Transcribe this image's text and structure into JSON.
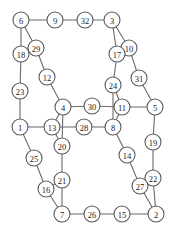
{
  "diagram": {
    "width": 178,
    "height": 232,
    "background_color": "#ffffff",
    "node_fill_color": "#ffffff",
    "node_stroke_color": "#5a5a5a",
    "edge_color": "#6b6b6b",
    "label_color": "#1a1a1a",
    "node_radius": 8,
    "node_count": 32,
    "edge_count": 48
  },
  "chart_data": {
    "type": "graph",
    "nodes": [
      {
        "id": 6,
        "label": "6",
        "x": 21,
        "y": 20
      },
      {
        "id": 9,
        "label": "9",
        "x": 55,
        "y": 20
      },
      {
        "id": 32,
        "label": "32",
        "x": 85,
        "y": 20
      },
      {
        "id": 3,
        "label": "3",
        "x": 112,
        "y": 20
      },
      {
        "id": 29,
        "label": "29",
        "x": 36,
        "y": 48
      },
      {
        "id": 10,
        "label": "10",
        "x": 129,
        "y": 48
      },
      {
        "id": 18,
        "label": "18",
        "x": 21,
        "y": 54
      },
      {
        "id": 17,
        "label": "17",
        "x": 117,
        "y": 54
      },
      {
        "id": 12,
        "label": "12",
        "x": 47,
        "y": 77
      },
      {
        "id": 31,
        "label": "31",
        "x": 139,
        "y": 78
      },
      {
        "id": 23,
        "label": "23",
        "x": 20,
        "y": 91
      },
      {
        "id": 24,
        "label": "24",
        "x": 113,
        "y": 85
      },
      {
        "id": 4,
        "label": "4",
        "x": 63,
        "y": 107
      },
      {
        "id": 30,
        "label": "30",
        "x": 92,
        "y": 106
      },
      {
        "id": 11,
        "label": "11",
        "x": 122,
        "y": 107
      },
      {
        "id": 5,
        "label": "5",
        "x": 155,
        "y": 107
      },
      {
        "id": 1,
        "label": "1",
        "x": 20,
        "y": 127
      },
      {
        "id": 13,
        "label": "13",
        "x": 52,
        "y": 127
      },
      {
        "id": 28,
        "label": "28",
        "x": 84,
        "y": 127
      },
      {
        "id": 8,
        "label": "8",
        "x": 113,
        "y": 127
      },
      {
        "id": 19,
        "label": "19",
        "x": 153,
        "y": 142
      },
      {
        "id": 20,
        "label": "20",
        "x": 62,
        "y": 146
      },
      {
        "id": 14,
        "label": "14",
        "x": 127,
        "y": 155
      },
      {
        "id": 25,
        "label": "25",
        "x": 34,
        "y": 158
      },
      {
        "id": 21,
        "label": "21",
        "x": 62,
        "y": 180
      },
      {
        "id": 22,
        "label": "22",
        "x": 153,
        "y": 178
      },
      {
        "id": 27,
        "label": "27",
        "x": 140,
        "y": 186
      },
      {
        "id": 16,
        "label": "16",
        "x": 46,
        "y": 189
      },
      {
        "id": 7,
        "label": "7",
        "x": 62,
        "y": 214
      },
      {
        "id": 26,
        "label": "26",
        "x": 92,
        "y": 214
      },
      {
        "id": 15,
        "label": "15",
        "x": 122,
        "y": 214
      },
      {
        "id": 2,
        "label": "2",
        "x": 156,
        "y": 214
      }
    ],
    "edges": [
      [
        6,
        9
      ],
      [
        9,
        32
      ],
      [
        32,
        3
      ],
      [
        6,
        18
      ],
      [
        6,
        29
      ],
      [
        29,
        18
      ],
      [
        29,
        12
      ],
      [
        18,
        23
      ],
      [
        23,
        1
      ],
      [
        12,
        4
      ],
      [
        3,
        17
      ],
      [
        3,
        10
      ],
      [
        10,
        17
      ],
      [
        10,
        31
      ],
      [
        31,
        5
      ],
      [
        17,
        24
      ],
      [
        24,
        11
      ],
      [
        11,
        5
      ],
      [
        11,
        30
      ],
      [
        30,
        4
      ],
      [
        4,
        13
      ],
      [
        4,
        20
      ],
      [
        1,
        13
      ],
      [
        13,
        28
      ],
      [
        28,
        8
      ],
      [
        24,
        8
      ],
      [
        11,
        8
      ],
      [
        8,
        14
      ],
      [
        14,
        27
      ],
      [
        5,
        19
      ],
      [
        19,
        22
      ],
      [
        22,
        27
      ],
      [
        22,
        2
      ],
      [
        27,
        2
      ],
      [
        13,
        20
      ],
      [
        20,
        21
      ],
      [
        21,
        7
      ],
      [
        21,
        16
      ],
      [
        16,
        25
      ],
      [
        25,
        1
      ],
      [
        7,
        26
      ],
      [
        26,
        15
      ],
      [
        15,
        2
      ],
      [
        7,
        16
      ],
      [
        30,
        11
      ],
      [
        8,
        28
      ],
      [
        4,
        30
      ],
      [
        24,
        17
      ]
    ],
    "directed": false,
    "layout": "planar-grid"
  }
}
